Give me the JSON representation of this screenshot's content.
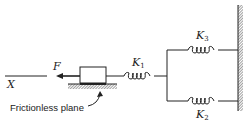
{
  "diagram": {
    "title": "",
    "axis_label": "X",
    "force_label": "F",
    "surface_caption": "Frictionless plane",
    "springs": [
      {
        "id": "k1",
        "symbol": "K",
        "subscript": "1",
        "connection": "series, block to junction"
      },
      {
        "id": "k3",
        "symbol": "K",
        "subscript": "3",
        "connection": "parallel upper branch, junction to wall"
      },
      {
        "id": "k2",
        "symbol": "K",
        "subscript": "2",
        "connection": "parallel lower branch, junction to wall"
      }
    ],
    "components": [
      "mass block",
      "fixed wall",
      "ground surface"
    ],
    "colors": {
      "ink": "#222222",
      "background": "#ffffff"
    }
  }
}
